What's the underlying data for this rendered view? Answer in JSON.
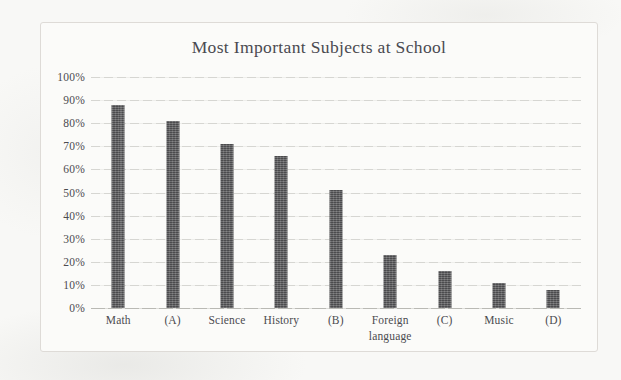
{
  "chart_data": {
    "type": "bar",
    "title": "Most Important Subjects at School",
    "xlabel": "",
    "ylabel": "",
    "categories": [
      "Math",
      "(A)",
      "Science",
      "History",
      "(B)",
      "Foreign language",
      "(C)",
      "Music",
      "(D)"
    ],
    "values": [
      88,
      81,
      71,
      66,
      51,
      23,
      16,
      11,
      8
    ],
    "value_labels": [
      "88%",
      "81%",
      "71%",
      "66%",
      "51%",
      "23%",
      "16%",
      "11%",
      "8%"
    ],
    "ylim": [
      0,
      100
    ],
    "ytick_values": [
      0,
      10,
      20,
      30,
      40,
      50,
      60,
      70,
      80,
      90,
      100
    ],
    "ytick_labels": [
      "0%",
      "10%",
      "20%",
      "30%",
      "40%",
      "50%",
      "60%",
      "70%",
      "80%",
      "90%",
      "100%"
    ],
    "grid": true,
    "legend": false,
    "legend_position": "none",
    "bar_color": "#5a5a5c",
    "grid_color": "#d6d6d2",
    "axis_color": "#b9b9b4",
    "text_color": "#4b4b50",
    "background_color": "#fbfbf9",
    "border_color": "#dedbd7"
  },
  "xtick_lines": [
    [
      "Math"
    ],
    [
      "(A)"
    ],
    [
      "Science"
    ],
    [
      "History"
    ],
    [
      "(B)"
    ],
    [
      "Foreign",
      "language"
    ],
    [
      "(C)"
    ],
    [
      "Music"
    ],
    [
      "(D)"
    ]
  ]
}
